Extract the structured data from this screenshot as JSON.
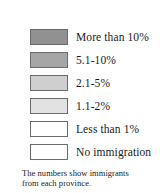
{
  "legend": {
    "title": "",
    "border_color": "#6b6b6b",
    "background": "#ffffff",
    "items": [
      {
        "label": "More than 10%",
        "color": "#919191",
        "swatch_name": "swatch-more-than-10-percent"
      },
      {
        "label": "5.1-10%",
        "color": "#a6a6a6",
        "swatch_name": "swatch-5-1-to-10-percent"
      },
      {
        "label": "2.1-5%",
        "color": "#cfcfcf",
        "swatch_name": "swatch-2-1-to-5-percent"
      },
      {
        "label": "1.1-2%",
        "color": "#e2e2e2",
        "swatch_name": "swatch-1-1-to-2-percent"
      },
      {
        "label": "Less than 1%",
        "color": "#ffffff",
        "swatch_name": "swatch-less-than-1-percent"
      },
      {
        "label": "No immigration",
        "color": "#ffffff",
        "swatch_name": "swatch-no-immigration"
      }
    ],
    "caption": {
      "line1": "The numbers show immigrants",
      "line2": "from each province."
    }
  }
}
